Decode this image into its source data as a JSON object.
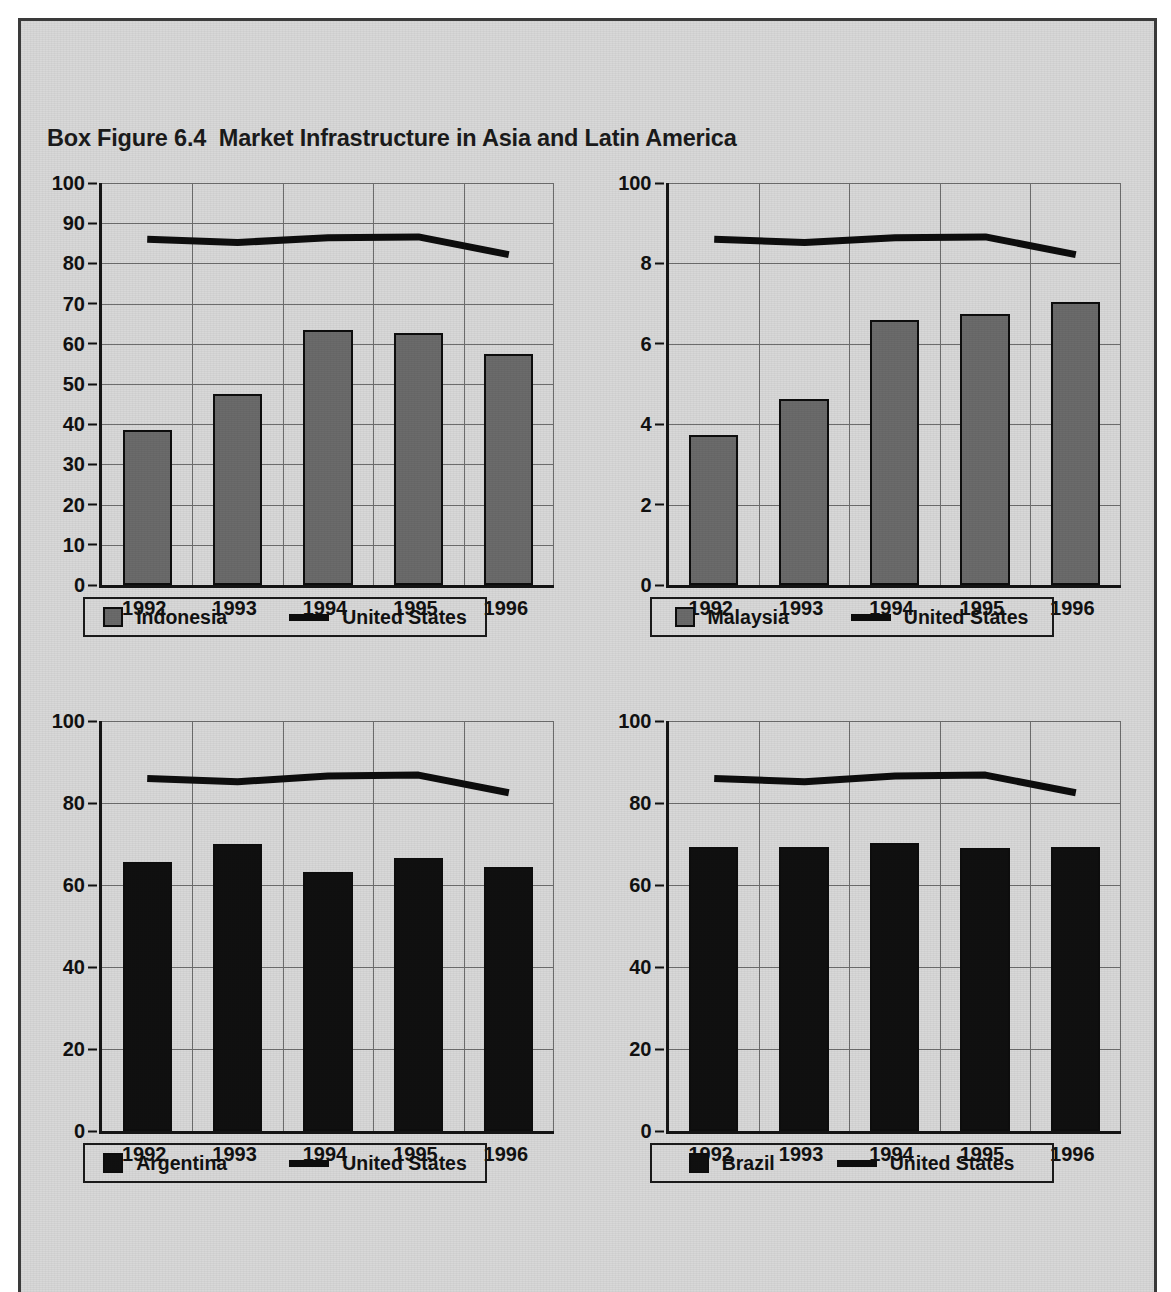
{
  "figure": {
    "label": "Box Figure 6.4",
    "title": "Market Infrastructure in Asia and Latin America",
    "full_title": "Box Figure 6.4  Market Infrastructure in Asia and Latin America"
  },
  "colors": {
    "asia_bar": "#6b6b6b",
    "latam_bar": "#101010",
    "line": "#0d0d0d",
    "panel_background": "#d8d8d8",
    "gridline": "#6d6d6d",
    "axis": "#151515",
    "frame_border": "#3a3a3a"
  },
  "panels": [
    {
      "id": "indonesia",
      "position": "top-left",
      "bar_series_label": "Indonesia",
      "line_series_label": "United States",
      "bar_style": "asia",
      "legend": {
        "bar_label": "Indonesia",
        "line_label": "United States"
      },
      "chart_data": {
        "type": "bar",
        "title": "Indonesia",
        "xlabel": "",
        "ylabel": "",
        "categories": [
          "1992",
          "1993",
          "1994",
          "1995",
          "1996"
        ],
        "ylim": [
          0,
          100
        ],
        "yticks": [
          0,
          10,
          20,
          30,
          40,
          50,
          60,
          70,
          80,
          90,
          100
        ],
        "ytick_labels": [
          "0",
          "10",
          "20",
          "30",
          "40",
          "50",
          "60",
          "70",
          "80",
          "90",
          "100"
        ],
        "grid": true,
        "legend_position": "below-axis",
        "series": [
          {
            "name": "Indonesia",
            "kind": "bar",
            "values": [
              38.5,
              47.5,
              63.5,
              62.8,
              57.5
            ]
          },
          {
            "name": "United States",
            "kind": "line",
            "values": [
              86.0,
              85.2,
              86.4,
              86.6,
              82.2
            ]
          }
        ]
      }
    },
    {
      "id": "malaysia",
      "position": "top-right",
      "bar_series_label": "Malaysia",
      "line_series_label": "United States",
      "bar_style": "asia",
      "legend": {
        "bar_label": "Malaysia",
        "line_label": "United States"
      },
      "chart_data": {
        "type": "bar",
        "title": "Malaysia",
        "xlabel": "",
        "ylabel": "",
        "categories": [
          "1992",
          "1993",
          "1994",
          "1995",
          "1996"
        ],
        "ylim": [
          0,
          10
        ],
        "yticks": [
          0,
          2,
          4,
          6,
          8,
          10
        ],
        "ytick_labels": [
          "0",
          "2",
          "4",
          "6",
          "8",
          "100"
        ],
        "grid": true,
        "legend_position": "below-axis",
        "series": [
          {
            "name": "Malaysia",
            "kind": "bar",
            "values": [
              3.72,
              4.62,
              6.6,
              6.75,
              7.05
            ]
          },
          {
            "name": "United States",
            "kind": "line",
            "values": [
              8.6,
              8.52,
              8.64,
              8.66,
              8.22
            ]
          }
        ]
      }
    },
    {
      "id": "argentina",
      "position": "bottom-left",
      "bar_series_label": "Argentina",
      "line_series_label": "United States",
      "bar_style": "latam",
      "legend": {
        "bar_label": "Argentina",
        "line_label": "United States"
      },
      "chart_data": {
        "type": "bar",
        "title": "Argentina",
        "xlabel": "",
        "ylabel": "",
        "categories": [
          "1992",
          "1993",
          "1994",
          "1995",
          "1996"
        ],
        "ylim": [
          0,
          100
        ],
        "yticks": [
          0,
          20,
          40,
          60,
          80,
          100
        ],
        "ytick_labels": [
          "0",
          "20",
          "40",
          "60",
          "80",
          "100"
        ],
        "grid": true,
        "legend_position": "below-axis",
        "series": [
          {
            "name": "Argentina",
            "kind": "bar",
            "values": [
              65.5,
              70.0,
              63.2,
              66.7,
              64.3
            ]
          },
          {
            "name": "United States",
            "kind": "line",
            "values": [
              86.0,
              85.2,
              86.6,
              86.8,
              82.5
            ]
          }
        ]
      }
    },
    {
      "id": "brazil",
      "position": "bottom-right",
      "bar_series_label": "Brazil",
      "line_series_label": "United States",
      "bar_style": "latam",
      "legend": {
        "bar_label": "Brazil",
        "line_label": "United States"
      },
      "chart_data": {
        "type": "bar",
        "title": "Brazil",
        "xlabel": "",
        "ylabel": "",
        "categories": [
          "1992",
          "1993",
          "1994",
          "1995",
          "1996"
        ],
        "ylim": [
          0,
          100
        ],
        "yticks": [
          0,
          20,
          40,
          60,
          80,
          100
        ],
        "ytick_labels": [
          "0",
          "20",
          "40",
          "60",
          "80",
          "100"
        ],
        "grid": true,
        "legend_position": "below-axis",
        "series": [
          {
            "name": "Brazil",
            "kind": "bar",
            "values": [
              69.2,
              69.3,
              70.2,
              69.0,
              69.2
            ]
          },
          {
            "name": "United States",
            "kind": "line",
            "values": [
              86.0,
              85.2,
              86.6,
              86.8,
              82.5
            ]
          }
        ]
      }
    }
  ]
}
